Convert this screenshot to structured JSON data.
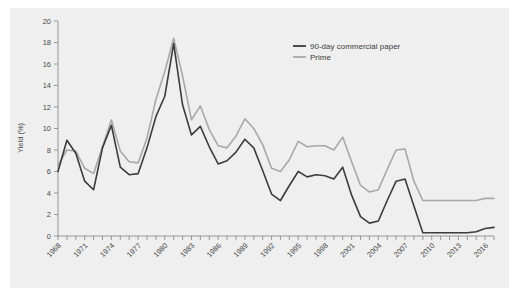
{
  "chart_data": {
    "type": "line",
    "title": "",
    "xlabel": "",
    "ylabel": "Yield (%)",
    "xlim": [
      1968,
      2017
    ],
    "ylim": [
      0,
      20
    ],
    "grid": false,
    "legend_position": "top-right",
    "ytick_labels": [
      "0",
      "2",
      "4",
      "6",
      "8",
      "10",
      "12",
      "14",
      "16",
      "18",
      "20"
    ],
    "ytick_values": [
      0,
      2,
      4,
      6,
      8,
      10,
      12,
      14,
      16,
      18,
      20
    ],
    "xtick_labels": [
      "1968",
      "1971",
      "1974",
      "1977",
      "1980",
      "1983",
      "1986",
      "1989",
      "1992",
      "1995",
      "1998",
      "2001",
      "2004",
      "2007",
      "2010",
      "2013",
      "2016"
    ],
    "x": [
      1968,
      1969,
      1970,
      1971,
      1972,
      1973,
      1974,
      1975,
      1976,
      1977,
      1978,
      1979,
      1980,
      1981,
      1982,
      1983,
      1984,
      1985,
      1986,
      1987,
      1988,
      1989,
      1990,
      1991,
      1992,
      1993,
      1994,
      1995,
      1996,
      1997,
      1998,
      1999,
      2000,
      2001,
      2002,
      2003,
      2004,
      2005,
      2006,
      2007,
      2008,
      2009,
      2010,
      2011,
      2012,
      2013,
      2014,
      2015,
      2016,
      2017
    ],
    "series": [
      {
        "name": "90-day commercial paper",
        "color": "#3c3c3c",
        "width": 1.6,
        "values": [
          6.0,
          8.9,
          7.7,
          5.1,
          4.3,
          8.2,
          10.3,
          6.4,
          5.7,
          5.8,
          8.2,
          11.1,
          13.0,
          17.9,
          12.2,
          9.4,
          10.2,
          8.3,
          6.7,
          7.0,
          7.8,
          9.0,
          8.2,
          6.1,
          3.9,
          3.3,
          4.7,
          6.0,
          5.5,
          5.7,
          5.6,
          5.3,
          6.4,
          3.8,
          1.8,
          1.2,
          1.4,
          3.3,
          5.1,
          5.3,
          2.8,
          0.3,
          0.3,
          0.3,
          0.3,
          0.3,
          0.3,
          0.4,
          0.7,
          0.8
        ]
      },
      {
        "name": "Prime",
        "color": "#a8a8a8",
        "width": 1.6,
        "values": [
          6.6,
          8.0,
          7.9,
          6.3,
          5.8,
          8.3,
          10.8,
          7.9,
          6.9,
          6.8,
          9.1,
          12.7,
          15.3,
          18.4,
          14.9,
          10.8,
          12.1,
          9.9,
          8.4,
          8.2,
          9.3,
          10.9,
          10.0,
          8.5,
          6.3,
          6.0,
          7.1,
          8.8,
          8.3,
          8.4,
          8.4,
          8.0,
          9.2,
          6.9,
          4.7,
          4.1,
          4.3,
          6.2,
          8.0,
          8.1,
          5.1,
          3.3,
          3.3,
          3.3,
          3.3,
          3.3,
          3.3,
          3.3,
          3.5,
          3.5
        ]
      }
    ]
  },
  "legend": {
    "items": [
      {
        "label": "90-day commercial paper",
        "color": "#3c3c3c"
      },
      {
        "label": "Prime",
        "color": "#a8a8a8"
      }
    ]
  },
  "axis": {
    "y_title": "Yield (%)"
  },
  "colors": {
    "panel_background": "#efefef",
    "page_background": "#ffffff",
    "axis": "#8c8c8c",
    "text": "#4a4a4a"
  }
}
